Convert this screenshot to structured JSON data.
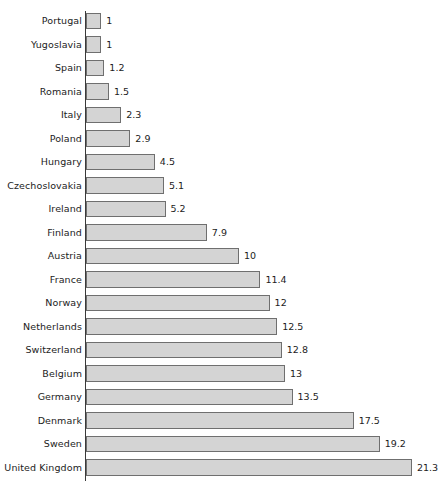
{
  "chart_data": {
    "type": "bar",
    "orientation": "horizontal",
    "title": "",
    "xlabel": "",
    "ylabel": "",
    "grid": false,
    "legend": null,
    "xlim": [
      0,
      21.3
    ],
    "axis_origin_value": 0,
    "categories": [
      "Portugal",
      "Yugoslavia",
      "Spain",
      "Romania",
      "Italy",
      "Poland",
      "Hungary",
      "Czechoslovakia",
      "Ireland",
      "Finland",
      "Austria",
      "France",
      "Norway",
      "Netherlands",
      "Switzerland",
      "Belgium",
      "Germany",
      "Denmark",
      "Sweden",
      "United Kingdom"
    ],
    "values": [
      1,
      1,
      1.2,
      1.5,
      2.3,
      2.9,
      4.5,
      5.1,
      5.2,
      7.9,
      10,
      11.4,
      12,
      12.5,
      12.8,
      13,
      13.5,
      17.5,
      19.2,
      21.3
    ],
    "value_labels": [
      "1",
      "1",
      "1.2",
      "1.5",
      "2.3",
      "2.9",
      "4.5",
      "5.1",
      "5.2",
      "7.9",
      "10",
      "11.4",
      "12",
      "12.5",
      "12.8",
      "13",
      "13.5",
      "17.5",
      "19.2",
      "21.3"
    ]
  },
  "style": {
    "bar_fill": "#d4d4d4",
    "bar_stroke": "#6f6f6f",
    "axis_color": "#3a3a3a",
    "text_color": "#1c1c1c",
    "background": "#ffffff"
  }
}
